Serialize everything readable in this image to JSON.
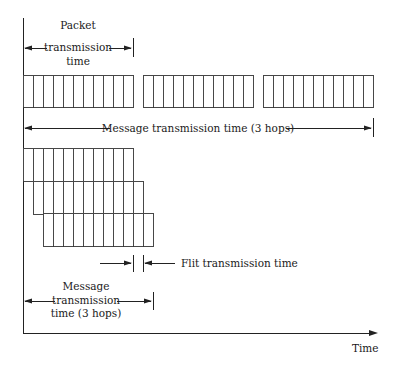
{
  "diagram": {
    "labels": {
      "packet_time": [
        "Packet",
        "transmission",
        "time"
      ],
      "message_time_sf": "Message transmission time (3 hops)",
      "flit_time": "Flit transmission time",
      "message_time_wh": [
        "Message",
        "transmission",
        "time (3 hops)"
      ],
      "x_axis": "Time"
    },
    "store_and_forward": {
      "packets": 3,
      "flits_per_packet": 11,
      "packet_x": [
        23,
        143,
        263
      ],
      "y_top": 75,
      "y_bottom": 107,
      "flit_width": 10
    },
    "wormhole": {
      "hops": 3,
      "flits_per_row": 11,
      "row_x": [
        23,
        33,
        43
      ],
      "row_y": [
        148,
        181,
        213
      ],
      "row_height": 33,
      "flit_width": 10
    },
    "colors": {
      "line": "#222222",
      "text": "#1a1a1a",
      "background": "#ffffff"
    }
  }
}
